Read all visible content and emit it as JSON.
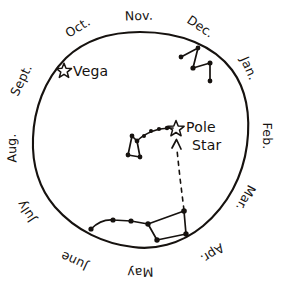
{
  "diagram": {
    "background_color": "#ffffff",
    "ink_color": "#16120f",
    "circle": {
      "cx": 140,
      "cy": 139,
      "r": 107
    },
    "months": [
      {
        "label": "Nov.",
        "angle_deg": -90,
        "x": 139,
        "y": 16,
        "rotate": -2
      },
      {
        "label": "Dec.",
        "angle_deg": -60,
        "x": 196,
        "y": 24,
        "rotate": 34
      },
      {
        "label": "Jan.",
        "angle_deg": -28,
        "x": 246,
        "y": 66,
        "rotate": 66
      },
      {
        "label": "Feb.",
        "angle_deg": 2,
        "x": 262,
        "y": 133,
        "rotate": 90
      },
      {
        "label": "Mar.",
        "angle_deg": 32,
        "x": 243,
        "y": 195,
        "rotate": 118
      },
      {
        "label": "Apr.",
        "angle_deg": 60,
        "x": 207,
        "y": 248,
        "rotate": 147
      },
      {
        "label": "May",
        "angle_deg": 88,
        "x": 139,
        "y": 264,
        "rotate": 178
      },
      {
        "label": "June",
        "angle_deg": 116,
        "x": 77,
        "y": 252,
        "rotate": 205
      },
      {
        "label": "July",
        "angle_deg": 146,
        "x": 33,
        "y": 208,
        "rotate": 237
      },
      {
        "label": "Aug.",
        "angle_deg": 176,
        "x": 17,
        "y": 146,
        "rotate": 268
      },
      {
        "label": "Sept.",
        "angle_deg": 208,
        "x": 26,
        "y": 80,
        "rotate": 296
      },
      {
        "label": "Oct.",
        "angle_deg": 238,
        "x": 78,
        "y": 28,
        "rotate": 328
      }
    ],
    "labeled_stars": [
      {
        "name": "Vega",
        "label": "Vega",
        "star_x": 64,
        "star_y": 70,
        "label_x": 75,
        "label_y": 76,
        "label_rotate": 0
      },
      {
        "name": "Pole Star",
        "label_line1": "Pole",
        "label_line2": "Star",
        "star_x": 176,
        "star_y": 128,
        "label_x": 187,
        "label_y": 128,
        "label2_x": 193,
        "label2_y": 146
      }
    ],
    "constellations": [
      {
        "name": "Cassiopeia",
        "shape": "W",
        "stars": [
          {
            "x": 181,
            "y": 57
          },
          {
            "x": 198,
            "y": 48
          },
          {
            "x": 193,
            "y": 68
          },
          {
            "x": 210,
            "y": 63
          },
          {
            "x": 210,
            "y": 81
          }
        ],
        "segments": [
          [
            0,
            1
          ],
          [
            1,
            2
          ],
          [
            2,
            3
          ],
          [
            3,
            4
          ]
        ]
      },
      {
        "name": "Little Dipper",
        "shape": "bowl-and-handle",
        "stars": [
          {
            "x": 176,
            "y": 128
          },
          {
            "x": 167,
            "y": 130
          },
          {
            "x": 158,
            "y": 130
          },
          {
            "x": 150,
            "y": 133
          },
          {
            "x": 143,
            "y": 137
          },
          {
            "x": 138,
            "y": 142
          },
          {
            "x": 133,
            "y": 136
          },
          {
            "x": 130,
            "y": 155
          },
          {
            "x": 140,
            "y": 157
          }
        ],
        "handle_path": "curved arc from bowl to Pole Star",
        "bowl_segments": [
          [
            5,
            6
          ],
          [
            6,
            7
          ],
          [
            7,
            8
          ],
          [
            8,
            5
          ]
        ]
      },
      {
        "name": "Big Dipper",
        "shape": "bowl-and-handle",
        "stars": [
          {
            "x": 91,
            "y": 229
          },
          {
            "x": 113,
            "y": 220
          },
          {
            "x": 131,
            "y": 221
          },
          {
            "x": 148,
            "y": 224
          },
          {
            "x": 157,
            "y": 239
          },
          {
            "x": 186,
            "y": 234
          },
          {
            "x": 184,
            "y": 211
          }
        ],
        "segments": [
          [
            0,
            1
          ],
          [
            1,
            2
          ],
          [
            2,
            3
          ],
          [
            3,
            4
          ],
          [
            4,
            5
          ],
          [
            5,
            6
          ],
          [
            6,
            3
          ]
        ]
      }
    ],
    "pointer": {
      "name": "pointer-to-pole-star",
      "style": "dashed-arrow",
      "from_x": 184,
      "from_y": 211,
      "to_x": 177,
      "to_y": 141,
      "description": "Dashed arrow from Big Dipper pointer stars up to the Pole Star"
    }
  }
}
